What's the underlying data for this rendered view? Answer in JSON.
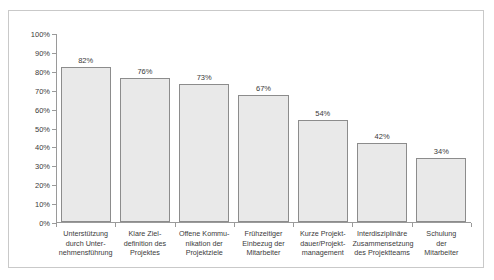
{
  "chart_data": {
    "type": "bar",
    "title": "",
    "subtitle": "",
    "xlabel": "",
    "ylabel": "",
    "ylim": [
      0,
      100
    ],
    "grid": false,
    "legend": false,
    "y_ticks": [
      "0%",
      "10%",
      "20%",
      "30%",
      "40%",
      "50%",
      "60%",
      "70%",
      "80%",
      "90%",
      "100%"
    ],
    "y_tick_values": [
      0,
      10,
      20,
      30,
      40,
      50,
      60,
      70,
      80,
      90,
      100
    ],
    "categories": [
      "Unterstützung durch Unter-nehmensführung",
      "Klare Ziel-definition des Projektes",
      "Offene Kommu-nikation der Projektziele",
      "Frühzeitiger Einbezug der Mitarbeiter",
      "Kurze Projekt-dauer/Projekt-management",
      "Interdisziplinäre Zusammensetzung des Projektteams",
      "Schulung der Mitarbeiter"
    ],
    "category_lines": [
      [
        "Unterstützung",
        "durch Unter-",
        "nehmensführung"
      ],
      [
        "Klare Ziel-",
        "definition des",
        "Projektes"
      ],
      [
        "Offene Kommu-",
        "nikation der",
        "Projektziele"
      ],
      [
        "Frühzeitiger",
        "Einbezug der",
        "Mitarbeiter"
      ],
      [
        "Kurze Projekt-",
        "dauer/Projekt-",
        "management"
      ],
      [
        "Interdisziplinäre",
        "Zusammensetzung",
        "des Projektteams"
      ],
      [
        "Schulung",
        "der",
        "Mitarbeiter"
      ]
    ],
    "values": [
      82,
      76,
      73,
      67,
      54,
      42,
      34
    ],
    "value_labels": [
      "82%",
      "76%",
      "73%",
      "67%",
      "54%",
      "42%",
      "34%"
    ],
    "bar_fill_color": "#e9e9e9",
    "bar_border_color": "#8c8c8c",
    "axis_color": "#9a9a9a",
    "text_color": "#3a3a3a",
    "frame_color": "#c9c9c9",
    "background_color": "#ffffff"
  }
}
